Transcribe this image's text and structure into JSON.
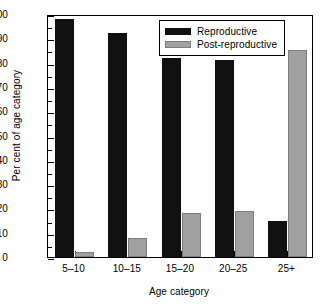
{
  "chart_data": {
    "type": "bar",
    "title": "",
    "xlabel": "Age category",
    "ylabel": "Per cent of age category",
    "categories": [
      "5–10",
      "10–15",
      "15–20",
      "20–25",
      "25+"
    ],
    "series": [
      {
        "name": "Reproductive",
        "color": "#111111",
        "values": [
          98,
          92,
          82,
          81,
          15
        ]
      },
      {
        "name": "Post-reproductive",
        "color": "#a0a0a0",
        "values": [
          2,
          8,
          18,
          19,
          85
        ]
      }
    ],
    "ylim": [
      0,
      100
    ],
    "ytick_values": [
      0,
      10,
      20,
      30,
      40,
      50,
      60,
      70,
      80,
      90,
      100
    ],
    "ytick_labels": [
      "0",
      "10",
      "20",
      "30",
      "40",
      "50",
      "60",
      "70",
      "80",
      "90",
      "100"
    ],
    "y_minor_step": 5,
    "grid": false,
    "legend_position": "top-right-inside",
    "frame": true,
    "tick_direction": "in"
  }
}
